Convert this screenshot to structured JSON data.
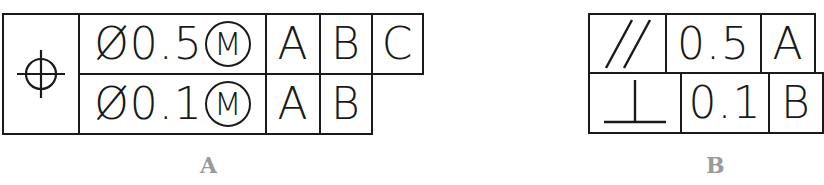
{
  "figure_a": {
    "caption": "A",
    "symbol": "position-icon",
    "rows": [
      {
        "diameter": "Ø",
        "tolerance": "0.5",
        "modifier": "M",
        "datums": [
          "A",
          "B",
          "C"
        ]
      },
      {
        "diameter": "Ø",
        "tolerance": "0.1",
        "modifier": "M",
        "datums": [
          "A",
          "B"
        ]
      }
    ]
  },
  "figure_b": {
    "caption": "B",
    "rows": [
      {
        "symbol": "parallelism-icon",
        "tolerance": "0.5",
        "datums": [
          "A"
        ]
      },
      {
        "symbol": "perpendicularity-icon",
        "tolerance": "0.1",
        "datums": [
          "B"
        ]
      }
    ]
  }
}
